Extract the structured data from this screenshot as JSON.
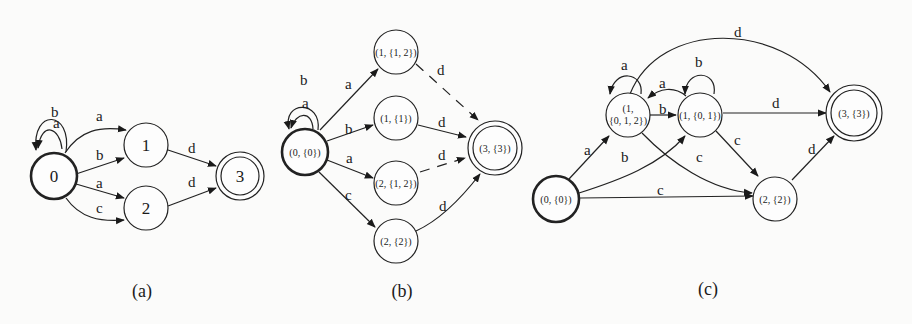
{
  "figure": {
    "panels": [
      {
        "id": "a",
        "caption": "(a)",
        "nodes": [
          {
            "id": "0",
            "label": "0",
            "start": true,
            "accept": false
          },
          {
            "id": "1",
            "label": "1",
            "start": false,
            "accept": false
          },
          {
            "id": "2",
            "label": "2",
            "start": false,
            "accept": false
          },
          {
            "id": "3",
            "label": "3",
            "start": false,
            "accept": true
          }
        ],
        "edges": [
          {
            "from": "0",
            "to": "0",
            "label": "a"
          },
          {
            "from": "0",
            "to": "0",
            "label": "b"
          },
          {
            "from": "0",
            "to": "1",
            "label": "a"
          },
          {
            "from": "0",
            "to": "1",
            "label": "b"
          },
          {
            "from": "0",
            "to": "2",
            "label": "a"
          },
          {
            "from": "0",
            "to": "2",
            "label": "c"
          },
          {
            "from": "1",
            "to": "3",
            "label": "d"
          },
          {
            "from": "2",
            "to": "3",
            "label": "d"
          }
        ]
      },
      {
        "id": "b",
        "caption": "(b)",
        "nodes": [
          {
            "id": "b0",
            "label": "(0, {0})",
            "start": true,
            "accept": false
          },
          {
            "id": "b1",
            "label": "(1, {1, 2})",
            "start": false,
            "accept": false
          },
          {
            "id": "b2",
            "label": "(1, {1})",
            "start": false,
            "accept": false
          },
          {
            "id": "b3",
            "label": "(2, {1, 2})",
            "start": false,
            "accept": false
          },
          {
            "id": "b4",
            "label": "(2, {2})",
            "start": false,
            "accept": false
          },
          {
            "id": "b5",
            "label": "(3, {3})",
            "start": false,
            "accept": true
          }
        ],
        "edges": [
          {
            "from": "b0",
            "to": "b0",
            "label": "a"
          },
          {
            "from": "b0",
            "to": "b0",
            "label": "b"
          },
          {
            "from": "b0",
            "to": "b1",
            "label": "a"
          },
          {
            "from": "b0",
            "to": "b2",
            "label": "b"
          },
          {
            "from": "b0",
            "to": "b3",
            "label": "a"
          },
          {
            "from": "b0",
            "to": "b4",
            "label": "c"
          },
          {
            "from": "b1",
            "to": "b5",
            "label": "d",
            "style": "dashed"
          },
          {
            "from": "b2",
            "to": "b5",
            "label": "d"
          },
          {
            "from": "b3",
            "to": "b5",
            "label": "d",
            "style": "dashed"
          },
          {
            "from": "b4",
            "to": "b5",
            "label": "d"
          }
        ]
      },
      {
        "id": "c",
        "caption": "(c)",
        "nodes": [
          {
            "id": "c0",
            "label": "(0, {0})",
            "start": true,
            "accept": false
          },
          {
            "id": "c1",
            "label_line1": "(1,",
            "label_line2": "{0, 1, 2})",
            "start": false,
            "accept": false
          },
          {
            "id": "c2",
            "label": "(1, {0, 1})",
            "start": false,
            "accept": false
          },
          {
            "id": "c3",
            "label": "(2, {2})",
            "start": false,
            "accept": false
          },
          {
            "id": "c4",
            "label": "(3, {3})",
            "start": false,
            "accept": true
          }
        ],
        "edges": [
          {
            "from": "c0",
            "to": "c1",
            "label": "a"
          },
          {
            "from": "c0",
            "to": "c2",
            "label": "b"
          },
          {
            "from": "c0",
            "to": "c3",
            "label": "c"
          },
          {
            "from": "c1",
            "to": "c1",
            "label": "a"
          },
          {
            "from": "c1",
            "to": "c2",
            "label": "b"
          },
          {
            "from": "c2",
            "to": "c1",
            "label": "a"
          },
          {
            "from": "c2",
            "to": "c2",
            "label": "b"
          },
          {
            "from": "c1",
            "to": "c3",
            "label": "c"
          },
          {
            "from": "c2",
            "to": "c3",
            "label": "c"
          },
          {
            "from": "c1",
            "to": "c4",
            "label": "d"
          },
          {
            "from": "c2",
            "to": "c4",
            "label": "d"
          },
          {
            "from": "c3",
            "to": "c4",
            "label": "d"
          }
        ]
      }
    ]
  }
}
